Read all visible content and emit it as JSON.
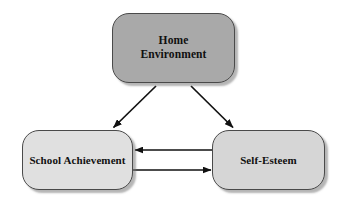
{
  "diagram": {
    "background_color": "#ffffff",
    "nodes": [
      {
        "id": "home-environment",
        "label": "Home\nEnvironment",
        "line1": "Home",
        "line2": "Environment",
        "fill_color": "#a9a9a9",
        "border_color": "#4a4a4a",
        "text_color": "#101010"
      },
      {
        "id": "school-achievement",
        "label": "School Achievement",
        "fill_color": "#e0e0e0",
        "border_color": "#4a4a4a",
        "text_color": "#101010"
      },
      {
        "id": "self-esteem",
        "label": "Self-Esteem",
        "fill_color": "#d6d6d6",
        "border_color": "#4a4a4a",
        "text_color": "#101010"
      }
    ],
    "edges": [
      {
        "id": "home-to-school",
        "from": "home-environment",
        "to": "school-achievement",
        "direction": "one-way",
        "label": "",
        "color": "#111111"
      },
      {
        "id": "home-to-self",
        "from": "home-environment",
        "to": "self-esteem",
        "direction": "one-way",
        "label": "",
        "color": "#111111"
      },
      {
        "id": "self-to-school",
        "from": "self-esteem",
        "to": "school-achievement",
        "direction": "one-way",
        "label": "",
        "color": "#111111"
      },
      {
        "id": "school-to-self",
        "from": "school-achievement",
        "to": "self-esteem",
        "direction": "one-way",
        "label": "",
        "color": "#111111"
      }
    ]
  }
}
